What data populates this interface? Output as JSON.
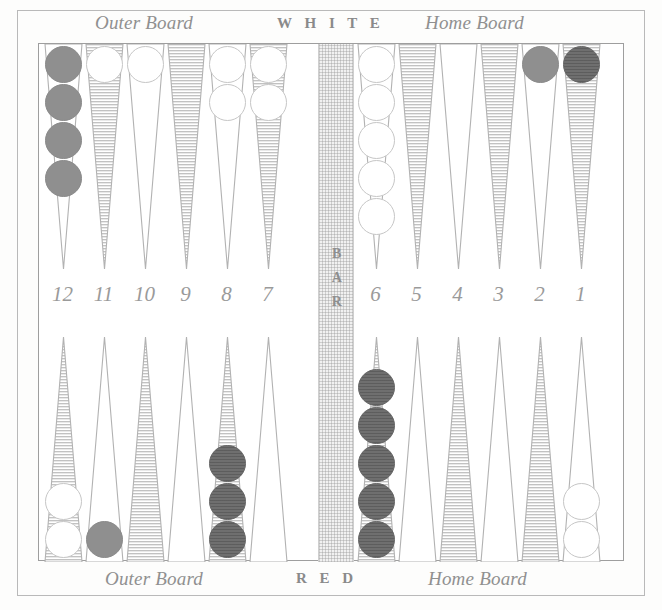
{
  "board": {
    "title": "Backgammon Board",
    "top_left_caption": "Outer Board",
    "top_right_caption": "Home Board",
    "bottom_left_caption": "Outer Board",
    "bottom_right_caption": "Home Board",
    "top_player": "W H I T E",
    "bottom_player": "R E D",
    "bar_label_letters": [
      "B",
      "A",
      "R"
    ],
    "colors": {
      "frame": "#b9b9b9",
      "playfield_border": "#9e9e9e",
      "background": "#ffffff",
      "bar_fill": "#f1f1f1",
      "point_line": "#b0b0b0",
      "point_hatch": "#bdbdbd",
      "checker_white": "#ffffff",
      "checker_gray": "#8f8f8f",
      "checker_dark": "#6f6f6f",
      "text": "#9a9a9a"
    }
  },
  "point_numbers": [
    "12",
    "11",
    "10",
    "9",
    "8",
    "7",
    "6",
    "5",
    "4",
    "3",
    "2",
    "1"
  ],
  "points": {
    "top": [
      {
        "number": "12",
        "style": "plain",
        "checkers": {
          "color": "gray",
          "count": 4
        }
      },
      {
        "number": "11",
        "style": "hatched",
        "checkers": {
          "color": "white",
          "count": 1
        }
      },
      {
        "number": "10",
        "style": "plain",
        "checkers": {
          "color": "white",
          "count": 1
        }
      },
      {
        "number": "9",
        "style": "hatched",
        "checkers": {
          "color": "none",
          "count": 0
        }
      },
      {
        "number": "8",
        "style": "plain",
        "checkers": {
          "color": "white",
          "count": 2
        }
      },
      {
        "number": "7",
        "style": "hatched",
        "checkers": {
          "color": "white",
          "count": 2
        }
      },
      {
        "number": "6",
        "style": "plain",
        "checkers": {
          "color": "white",
          "count": 5
        }
      },
      {
        "number": "5",
        "style": "hatched",
        "checkers": {
          "color": "none",
          "count": 0
        }
      },
      {
        "number": "4",
        "style": "plain",
        "checkers": {
          "color": "none",
          "count": 0
        }
      },
      {
        "number": "3",
        "style": "hatched",
        "checkers": {
          "color": "none",
          "count": 0
        }
      },
      {
        "number": "2",
        "style": "plain",
        "checkers": {
          "color": "gray",
          "count": 1
        }
      },
      {
        "number": "1",
        "style": "hatched",
        "checkers": {
          "color": "dark",
          "count": 1
        }
      }
    ],
    "bottom": [
      {
        "number": "12",
        "style": "hatched",
        "checkers": {
          "color": "white",
          "count": 2
        }
      },
      {
        "number": "11",
        "style": "plain",
        "checkers": {
          "color": "gray",
          "count": 1
        }
      },
      {
        "number": "10",
        "style": "hatched",
        "checkers": {
          "color": "none",
          "count": 0
        }
      },
      {
        "number": "9",
        "style": "plain",
        "checkers": {
          "color": "none",
          "count": 0
        }
      },
      {
        "number": "8",
        "style": "hatched",
        "checkers": {
          "color": "dark",
          "count": 3
        }
      },
      {
        "number": "7",
        "style": "plain",
        "checkers": {
          "color": "none",
          "count": 0
        }
      },
      {
        "number": "6",
        "style": "hatched",
        "checkers": {
          "color": "dark",
          "count": 5
        }
      },
      {
        "number": "5",
        "style": "plain",
        "checkers": {
          "color": "none",
          "count": 0
        }
      },
      {
        "number": "4",
        "style": "hatched",
        "checkers": {
          "color": "none",
          "count": 0
        }
      },
      {
        "number": "3",
        "style": "plain",
        "checkers": {
          "color": "none",
          "count": 0
        }
      },
      {
        "number": "2",
        "style": "hatched",
        "checkers": {
          "color": "none",
          "count": 0
        }
      },
      {
        "number": "1",
        "style": "plain",
        "checkers": {
          "color": "white",
          "count": 2
        }
      }
    ]
  }
}
